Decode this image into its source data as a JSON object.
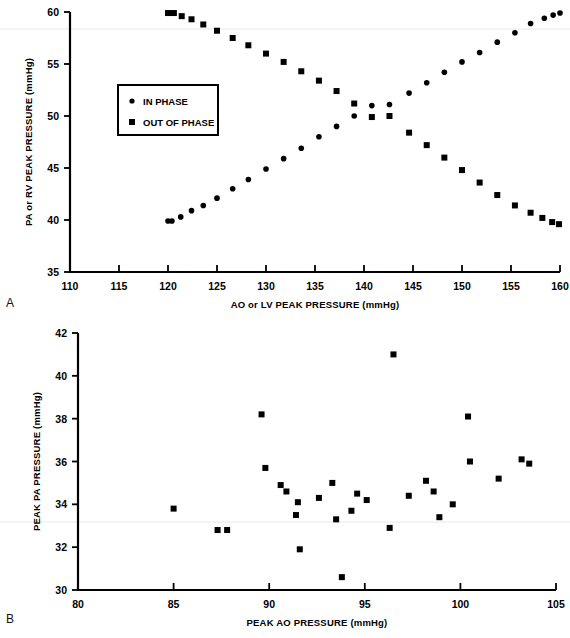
{
  "figure": {
    "panel_a_letter": "A",
    "panel_b_letter": "B"
  },
  "chart_data": [
    {
      "panel": "A",
      "type": "scatter",
      "title": "",
      "xlabel": "AO or LV PEAK PRESSURE  (mmHg)",
      "ylabel": "PA or RV PEAK PRESSURE (mmHg)",
      "xlim": [
        110,
        160
      ],
      "ylim": [
        35,
        60
      ],
      "xticks": [
        110,
        115,
        120,
        125,
        130,
        135,
        140,
        145,
        150,
        155,
        160
      ],
      "yticks": [
        35,
        40,
        45,
        50,
        55,
        60
      ],
      "grid": false,
      "legend_position": "upper-left-inside",
      "legend": [
        {
          "label": "IN PHASE",
          "marker": "circle"
        },
        {
          "label": "OUT OF PHASE",
          "marker": "square"
        }
      ],
      "series": [
        {
          "name": "IN PHASE",
          "marker": "circle",
          "points": [
            [
              120.0,
              39.9
            ],
            [
              120.4,
              39.9
            ],
            [
              121.3,
              40.3
            ],
            [
              122.4,
              40.9
            ],
            [
              123.6,
              41.4
            ],
            [
              125.0,
              42.1
            ],
            [
              126.6,
              43.0
            ],
            [
              128.2,
              43.9
            ],
            [
              130.0,
              44.9
            ],
            [
              131.8,
              45.9
            ],
            [
              133.6,
              46.9
            ],
            [
              135.4,
              48.0
            ],
            [
              137.2,
              49.0
            ],
            [
              139.0,
              50.0
            ],
            [
              140.8,
              51.0
            ],
            [
              142.6,
              51.1
            ],
            [
              144.6,
              52.2
            ],
            [
              146.4,
              53.2
            ],
            [
              148.2,
              54.2
            ],
            [
              150.0,
              55.2
            ],
            [
              151.8,
              56.1
            ],
            [
              153.6,
              57.1
            ],
            [
              155.4,
              58.0
            ],
            [
              157.0,
              58.9
            ],
            [
              158.4,
              59.4
            ],
            [
              159.3,
              59.7
            ],
            [
              160.0,
              59.9
            ]
          ]
        },
        {
          "name": "OUT OF PHASE",
          "marker": "square",
          "points": [
            [
              120.0,
              59.9
            ],
            [
              120.6,
              59.9
            ],
            [
              121.4,
              59.6
            ],
            [
              122.4,
              59.3
            ],
            [
              123.6,
              58.8
            ],
            [
              125.0,
              58.2
            ],
            [
              126.6,
              57.5
            ],
            [
              128.2,
              56.8
            ],
            [
              130.0,
              56.0
            ],
            [
              131.8,
              55.2
            ],
            [
              133.6,
              54.3
            ],
            [
              135.4,
              53.4
            ],
            [
              137.2,
              52.4
            ],
            [
              139.0,
              51.2
            ],
            [
              140.8,
              49.9
            ],
            [
              142.6,
              50.0
            ],
            [
              144.6,
              48.4
            ],
            [
              146.4,
              47.2
            ],
            [
              148.2,
              46.0
            ],
            [
              150.0,
              44.8
            ],
            [
              151.8,
              43.6
            ],
            [
              153.6,
              42.4
            ],
            [
              155.4,
              41.4
            ],
            [
              157.0,
              40.7
            ],
            [
              158.2,
              40.2
            ],
            [
              159.2,
              39.8
            ],
            [
              159.9,
              39.6
            ]
          ]
        }
      ]
    },
    {
      "panel": "B",
      "type": "scatter",
      "title": "",
      "xlabel": "PEAK AO PRESSURE (mmHg)",
      "ylabel": "PEAK PA PRESSURE (mmHg)",
      "xlim": [
        80,
        105
      ],
      "ylim": [
        30,
        42
      ],
      "xticks": [
        80,
        85,
        90,
        95,
        100,
        105
      ],
      "yticks": [
        30,
        32,
        34,
        36,
        38,
        40,
        42
      ],
      "grid": false,
      "legend_position": "none",
      "series": [
        {
          "name": "PEAK PA vs PEAK AO",
          "marker": "square",
          "points": [
            [
              85.0,
              33.8
            ],
            [
              87.3,
              32.8
            ],
            [
              87.8,
              32.8
            ],
            [
              89.6,
              38.2
            ],
            [
              89.8,
              35.7
            ],
            [
              90.6,
              34.9
            ],
            [
              90.9,
              34.6
            ],
            [
              91.5,
              34.1
            ],
            [
              91.4,
              33.5
            ],
            [
              91.6,
              31.9
            ],
            [
              92.6,
              34.3
            ],
            [
              93.3,
              35.0
            ],
            [
              93.5,
              33.3
            ],
            [
              93.8,
              30.6
            ],
            [
              94.3,
              33.7
            ],
            [
              94.6,
              34.5
            ],
            [
              95.1,
              34.2
            ],
            [
              96.5,
              41.0
            ],
            [
              96.3,
              32.9
            ],
            [
              97.3,
              34.4
            ],
            [
              98.2,
              35.1
            ],
            [
              98.6,
              34.6
            ],
            [
              98.9,
              33.4
            ],
            [
              99.6,
              34.0
            ],
            [
              100.4,
              38.1
            ],
            [
              100.5,
              36.0
            ],
            [
              102.0,
              35.2
            ],
            [
              103.2,
              36.1
            ],
            [
              103.6,
              35.9
            ]
          ]
        }
      ]
    }
  ]
}
